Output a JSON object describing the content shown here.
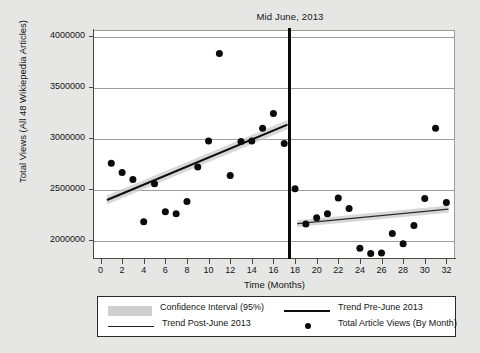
{
  "chart_data": {
    "type": "scatter",
    "title": "Mid June, 2013",
    "xlabel": "Time (Months)",
    "ylabel": "Total Views (All 48 Wikiepedia Articles)",
    "xlim": [
      -0.6,
      32.8
    ],
    "ylim": [
      1820000,
      4060000
    ],
    "xticks": [
      0,
      2,
      4,
      6,
      8,
      10,
      12,
      14,
      16,
      18,
      20,
      22,
      24,
      26,
      28,
      30,
      32
    ],
    "xtick_labels": [
      "0",
      "2",
      "4",
      "6",
      "8",
      "10",
      "12",
      "14",
      "16",
      "18",
      "20",
      "22",
      "24",
      "26",
      "28",
      "30",
      "32"
    ],
    "yticks": [
      2000000,
      2500000,
      3000000,
      3500000,
      4000000
    ],
    "ytick_labels": [
      "2000000",
      "2500000",
      "3000000",
      "3500000",
      "4000000"
    ],
    "grid": "horizontal",
    "legend_position": "below-axes",
    "annotations": [
      {
        "name": "mid-june-line",
        "label": "Mid June, 2013",
        "x": 17.5,
        "type": "vertical-line"
      }
    ],
    "points": [
      {
        "x": 1,
        "y": 2760000
      },
      {
        "x": 2,
        "y": 2670000
      },
      {
        "x": 3,
        "y": 2600000
      },
      {
        "x": 4,
        "y": 2185000
      },
      {
        "x": 5,
        "y": 2560000
      },
      {
        "x": 6,
        "y": 2285000
      },
      {
        "x": 7,
        "y": 2265000
      },
      {
        "x": 8,
        "y": 2385000
      },
      {
        "x": 9,
        "y": 2725000
      },
      {
        "x": 10,
        "y": 2980000
      },
      {
        "x": 11,
        "y": 3840000
      },
      {
        "x": 12,
        "y": 2640000
      },
      {
        "x": 13,
        "y": 2975000
      },
      {
        "x": 14,
        "y": 2980000
      },
      {
        "x": 15,
        "y": 3105000
      },
      {
        "x": 16,
        "y": 3250000
      },
      {
        "x": 17,
        "y": 2955000
      },
      {
        "x": 18,
        "y": 2510000
      },
      {
        "x": 19,
        "y": 2165000
      },
      {
        "x": 20,
        "y": 2225000
      },
      {
        "x": 21,
        "y": 2265000
      },
      {
        "x": 22,
        "y": 2420000
      },
      {
        "x": 23,
        "y": 2315000
      },
      {
        "x": 24,
        "y": 1925000
      },
      {
        "x": 25,
        "y": 1875000
      },
      {
        "x": 26,
        "y": 1880000
      },
      {
        "x": 27,
        "y": 2070000
      },
      {
        "x": 28,
        "y": 1970000
      },
      {
        "x": 29,
        "y": 2150000
      },
      {
        "x": 30,
        "y": 2415000
      },
      {
        "x": 31,
        "y": 3105000
      },
      {
        "x": 32,
        "y": 2375000
      }
    ],
    "series": [
      {
        "name": "Trend Pre-June 2013",
        "type": "line",
        "x": [
          0.6,
          17.3
        ],
        "y": [
          2400000,
          3140000
        ],
        "ci_lower": [
          2355000,
          3095000
        ],
        "ci_upper": [
          2445000,
          3185000
        ]
      },
      {
        "name": "Trend Post-June 2013",
        "type": "line",
        "x": [
          18.2,
          32.2
        ],
        "y": [
          2168000,
          2310000
        ],
        "ci_lower": [
          2135000,
          2275000
        ],
        "ci_upper": [
          2200000,
          2345000
        ]
      }
    ],
    "legend": [
      {
        "label": "Confidence Interval (95%)",
        "key": "band-swatch"
      },
      {
        "label": "Trend Pre-June 2013",
        "key": "thick-line"
      },
      {
        "label": "Trend Post-June 2013",
        "key": "thin-line"
      },
      {
        "label": "Total Article Views (By Month)",
        "key": "dot"
      }
    ]
  },
  "colors": {
    "figure_background": "#e6e6e4",
    "plot_background": "#ffffff",
    "gridline": "#9c9c9c",
    "axis": "#4a4a4a",
    "point": "#0b0b0b",
    "trend_pre": "#0d0d0d",
    "trend_post": "#2a2a2a",
    "confidence_band": "#c9c9c9",
    "vertical_line": "#0a0a0a",
    "text": "#141414"
  }
}
